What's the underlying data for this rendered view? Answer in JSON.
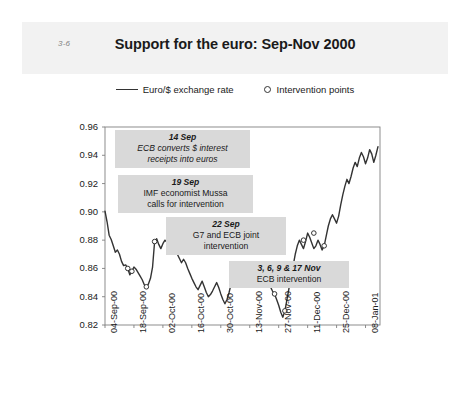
{
  "slide": {
    "number": "3-6",
    "title": "Support for the euro: Sep-Nov 2000"
  },
  "legend": {
    "series_label": "Euro/$ exchange rate",
    "marker_label": "Intervention points"
  },
  "annotations": [
    {
      "heading": "14 Sep",
      "line1": "ECB converts $ interest",
      "line2": "receipts into euros",
      "italic_body": true
    },
    {
      "heading": "19 Sep",
      "line1": "IMF economist Mussa",
      "line2": "calls for intervention",
      "italic_body": false
    },
    {
      "heading": "22 Sep",
      "line1": "G7 and ECB joint",
      "line2": "intervention",
      "italic_body": false
    },
    {
      "heading": "3, 6, 9 & 17 Nov",
      "line1": "ECB intervention",
      "line2": "",
      "italic_body": false
    }
  ],
  "colors": {
    "line": "#333333",
    "header_band": "#f2f2f2",
    "annotation_bg": "#d9d9d9",
    "axis": "#808080",
    "text": "#1a1a1a"
  },
  "chart_data": {
    "type": "line",
    "title": "Support for the euro: Sep-Nov 2000",
    "xlabel": "",
    "ylabel": "",
    "ylim": [
      0.82,
      0.96
    ],
    "yticks": [
      0.82,
      0.84,
      0.86,
      0.88,
      0.9,
      0.92,
      0.94,
      0.96
    ],
    "ytick_labels": [
      "0.82",
      "0.84",
      "0.86",
      "0.88",
      "0.90",
      "0.92",
      "0.94",
      "0.96"
    ],
    "xtick_labels": [
      "04-Sep-00",
      "18-Sep-00",
      "02-Oct-00",
      "16-Oct-00",
      "30-Oct-00",
      "13-Nov-00",
      "27-Nov-00",
      "11-Dec-00",
      "25-Dec-00",
      "08-Jan-01"
    ],
    "xtick_positions": [
      0,
      14,
      28,
      42,
      56,
      70,
      84,
      98,
      112,
      126
    ],
    "xlim": [
      0,
      133
    ],
    "grid": false,
    "legend_position": "top",
    "series": [
      {
        "name": "Euro/$ exchange rate",
        "x": [
          0,
          1,
          2,
          3,
          4,
          5,
          6,
          7,
          8,
          9,
          10,
          11,
          12,
          13,
          14,
          15,
          16,
          17,
          18,
          19,
          20,
          21,
          22,
          23,
          24,
          25,
          26,
          27,
          28,
          29,
          30,
          31,
          32,
          33,
          34,
          35,
          36,
          37,
          38,
          39,
          40,
          41,
          42,
          43,
          44,
          45,
          46,
          47,
          48,
          49,
          50,
          51,
          52,
          53,
          54,
          55,
          56,
          57,
          58,
          59,
          60,
          61,
          62,
          63,
          64,
          65,
          66,
          67,
          68,
          69,
          70,
          71,
          72,
          73,
          74,
          75,
          76,
          77,
          78,
          79,
          80,
          81,
          82,
          83,
          84,
          85,
          86,
          87,
          88,
          89,
          90,
          91,
          92,
          93,
          94,
          95,
          96,
          97,
          98,
          99,
          100,
          101,
          102,
          103,
          104,
          105,
          106,
          107,
          108,
          109,
          110,
          111,
          112,
          113,
          114,
          115,
          116,
          117,
          118,
          119,
          120,
          121,
          122,
          123,
          124,
          125,
          126,
          127,
          128,
          129,
          130,
          131,
          132
        ],
        "y": [
          0.9005,
          0.893,
          0.8835,
          0.8805,
          0.876,
          0.8715,
          0.873,
          0.87,
          0.865,
          0.862,
          0.8625,
          0.86,
          0.8555,
          0.858,
          0.861,
          0.8595,
          0.857,
          0.8545,
          0.852,
          0.8485,
          0.847,
          0.849,
          0.853,
          0.861,
          0.879,
          0.881,
          0.877,
          0.874,
          0.8775,
          0.88,
          0.8785,
          0.876,
          0.879,
          0.877,
          0.873,
          0.87,
          0.867,
          0.864,
          0.8665,
          0.864,
          0.86,
          0.8565,
          0.853,
          0.85,
          0.847,
          0.845,
          0.848,
          0.851,
          0.847,
          0.843,
          0.84,
          0.8415,
          0.844,
          0.847,
          0.85,
          0.8465,
          0.842,
          0.838,
          0.835,
          0.838,
          0.843,
          0.849,
          0.854,
          0.858,
          0.86,
          0.857,
          0.853,
          0.85,
          0.853,
          0.858,
          0.86,
          0.861,
          0.859,
          0.856,
          0.858,
          0.86,
          0.858,
          0.8545,
          0.852,
          0.849,
          0.847,
          0.844,
          0.842,
          0.838,
          0.834,
          0.829,
          0.8255,
          0.83,
          0.838,
          0.846,
          0.854,
          0.862,
          0.87,
          0.876,
          0.88,
          0.877,
          0.874,
          0.879,
          0.885,
          0.882,
          0.878,
          0.874,
          0.876,
          0.88,
          0.877,
          0.873,
          0.876,
          0.883,
          0.89,
          0.895,
          0.898,
          0.895,
          0.892,
          0.897,
          0.905,
          0.912,
          0.918,
          0.923,
          0.92,
          0.925,
          0.931,
          0.935,
          0.932,
          0.938,
          0.942,
          0.939,
          0.934,
          0.938,
          0.944,
          0.941,
          0.935,
          0.94,
          0.946
        ]
      }
    ],
    "intervention_points": [
      {
        "x": 11,
        "y": 0.86
      },
      {
        "x": 13,
        "y": 0.858
      },
      {
        "x": 20,
        "y": 0.847
      },
      {
        "x": 24,
        "y": 0.879
      },
      {
        "x": 79,
        "y": 0.849
      },
      {
        "x": 82,
        "y": 0.842
      },
      {
        "x": 87,
        "y": 0.83
      },
      {
        "x": 91,
        "y": 0.862
      },
      {
        "x": 96,
        "y": 0.88
      },
      {
        "x": 101,
        "y": 0.885
      },
      {
        "x": 106,
        "y": 0.876
      }
    ]
  }
}
